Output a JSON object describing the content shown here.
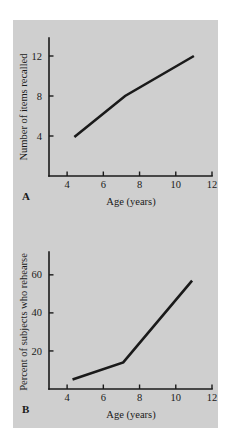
{
  "figure": {
    "background_color": "#cfcfcf",
    "page_color": "#ffffff",
    "line_color": "#1a1a1a",
    "panel_a_letter": "A",
    "panel_b_letter": "B"
  },
  "chart_data": [
    {
      "type": "line",
      "panel": "A",
      "title": "",
      "xlabel": "Age  (years)",
      "ylabel": "Number of items recalled",
      "xlim": [
        3,
        12
      ],
      "ylim": [
        0,
        13.8
      ],
      "xticks": [
        4,
        6,
        8,
        10,
        12
      ],
      "xticklabels": [
        "4",
        "6",
        "8",
        "10",
        "12"
      ],
      "yticks": [
        4,
        8,
        12
      ],
      "yticklabels": [
        "4",
        "8",
        "12"
      ],
      "grid": false,
      "legend": "none",
      "x": [
        4.4,
        7.2,
        11.0
      ],
      "values": [
        3.9,
        8.0,
        12.0
      ],
      "series": [
        {
          "name": "Number of items recalled",
          "x": [
            4.4,
            7.2,
            11.0
          ],
          "values": [
            3.9,
            8.0,
            12.0
          ]
        }
      ]
    },
    {
      "type": "line",
      "panel": "B",
      "title": "",
      "xlabel": "Age  (years)",
      "ylabel": "Percent of subjects who rehearse",
      "xlim": [
        3,
        12
      ],
      "ylim": [
        0,
        72
      ],
      "xticks": [
        4,
        6,
        8,
        10,
        12
      ],
      "xticklabels": [
        "4",
        "6",
        "8",
        "10",
        "12"
      ],
      "yticks": [
        20,
        40,
        60
      ],
      "yticklabels": [
        "20",
        "40",
        "60"
      ],
      "grid": false,
      "legend": "none",
      "x": [
        4.3,
        7.1,
        10.9
      ],
      "values": [
        5,
        14,
        57
      ],
      "series": [
        {
          "name": "Percent of subjects who rehearse",
          "x": [
            4.3,
            7.1,
            10.9
          ],
          "values": [
            5,
            14,
            57
          ]
        }
      ]
    }
  ]
}
